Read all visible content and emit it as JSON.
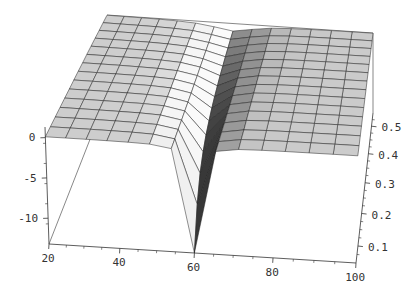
{
  "chart_data": {
    "type": "surface",
    "title": "",
    "subtitle": "",
    "style": "grayscale-lit-mesh-3d",
    "background": "#ffffff",
    "x_axis": {
      "min": 20,
      "max": 100,
      "tick_values": [
        20,
        40,
        60,
        80,
        100
      ],
      "tick_labels": [
        "20",
        "40",
        "60",
        "80",
        "100"
      ],
      "minor_step": 5,
      "label": ""
    },
    "y_axis": {
      "min": 0.05,
      "max": 0.55,
      "tick_values": [
        0.1,
        0.2,
        0.3,
        0.4,
        0.5
      ],
      "tick_labels": [
        "0.1",
        "0.2",
        "0.3",
        "0.4",
        "0.5"
      ],
      "minor_step": 0.025,
      "label": ""
    },
    "z_axis": {
      "min": -13.2,
      "max": 1.32,
      "tick_values": [
        0,
        -5,
        -10
      ],
      "tick_labels": [
        "0",
        "-5",
        "-10"
      ],
      "minor_step": 2.5,
      "label": ""
    },
    "mesh": {
      "nx": 15,
      "ny": 15
    },
    "surface_model": {
      "description": "Nearly flat sheet rising linearly toward the back (z = slope*y) cut by a narrow Lorentzian trench centered at x = 60; trench depth grows like amp/y so it plunges to the plot floor at the front edge and is a shallow wide groove at the back.",
      "base_slope": 2.4,
      "trench_amp": 0.75,
      "trench_center_x": 60,
      "trench_width_base": 0.5,
      "trench_width_slope": 12,
      "clip_min": -13.2,
      "clip_max": 1.32
    },
    "lighting": {
      "direction": [
        0.8,
        -0.12,
        0.58
      ],
      "ambient": 0.6,
      "diffuse": 0.42,
      "gamma": 1.35
    },
    "colors": {
      "background": "#ffffff",
      "mesh_line": "#222222",
      "axis_line": "#333333",
      "box_edge": "#555555",
      "tick_label": "#333333",
      "surface_bright": "#f5f5f5",
      "surface_flat": "#cccccc",
      "surface_shadow": "#373737"
    }
  }
}
